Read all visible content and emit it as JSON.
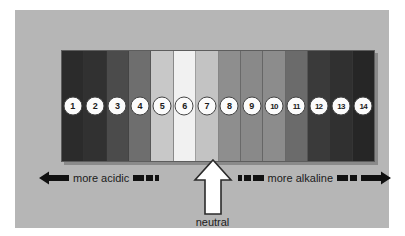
{
  "diagram": {
    "background_color": "#b6b6b6",
    "page_color": "#ffffff"
  },
  "scale": {
    "bands": [
      {
        "value": "1",
        "color": "#2b2b2b"
      },
      {
        "value": "2",
        "color": "#313131"
      },
      {
        "value": "3",
        "color": "#4b4b4b"
      },
      {
        "value": "4",
        "color": "#6e6e6e"
      },
      {
        "value": "5",
        "color": "#c8c8c8"
      },
      {
        "value": "6",
        "color": "#f1f1f1"
      },
      {
        "value": "7",
        "color": "#c3c3c3"
      },
      {
        "value": "8",
        "color": "#8e8e8e"
      },
      {
        "value": "9",
        "color": "#898989"
      },
      {
        "value": "10",
        "color": "#8c8c8c"
      },
      {
        "value": "11",
        "color": "#6b6b6b"
      },
      {
        "value": "12",
        "color": "#3a3a3a"
      },
      {
        "value": "13",
        "color": "#303030"
      },
      {
        "value": "14",
        "color": "#262626"
      }
    ]
  },
  "annotations": {
    "acidic_label": "more acidic",
    "alkaline_label": "more alkaline",
    "neutral_label": "neutral",
    "neutral_points_to": "7",
    "arrow_color": "#111111",
    "neutral_arrow_fill": "#ffffff",
    "neutral_arrow_stroke": "#2b2b2b"
  }
}
